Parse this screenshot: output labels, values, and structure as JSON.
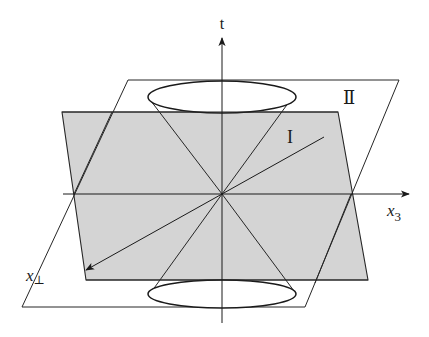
{
  "diagram": {
    "title": "",
    "labels": {
      "t_axis": "t",
      "x3_axis": "x",
      "x3_sub": "3",
      "xperp_axis": "x",
      "xperp_sub": "⊥",
      "region_I": "I",
      "region_II": "Ⅱ"
    },
    "colors": {
      "background": "#ffffff",
      "plane_I_fill": "#d4d4d4",
      "line": "#262626"
    },
    "planes": [
      {
        "id": "I",
        "shaded": true,
        "corners": [
          [
            62,
            112
          ],
          [
            338,
            112
          ],
          [
            368,
            280
          ],
          [
            86,
            280
          ]
        ]
      },
      {
        "id": "II",
        "shaded": false,
        "corners": [
          [
            128,
            80
          ],
          [
            399,
            80
          ],
          [
            305,
            307
          ],
          [
            22,
            307
          ]
        ]
      }
    ],
    "light_cone": {
      "apex": [
        222,
        194
      ],
      "upper_ellipse": {
        "cx": 222,
        "cy": 97,
        "rx": 74,
        "ry": 16
      },
      "lower_ellipse": {
        "cx": 222,
        "cy": 294,
        "rx": 74,
        "ry": 14
      }
    },
    "axes": [
      {
        "name": "t",
        "from": [
          222,
          323
        ],
        "to": [
          222,
          37
        ]
      },
      {
        "name": "x3",
        "from": [
          63,
          194
        ],
        "to": [
          410,
          194
        ]
      },
      {
        "name": "x_perp",
        "from": [
          324,
          137
        ],
        "to": [
          85,
          271
        ]
      }
    ]
  }
}
